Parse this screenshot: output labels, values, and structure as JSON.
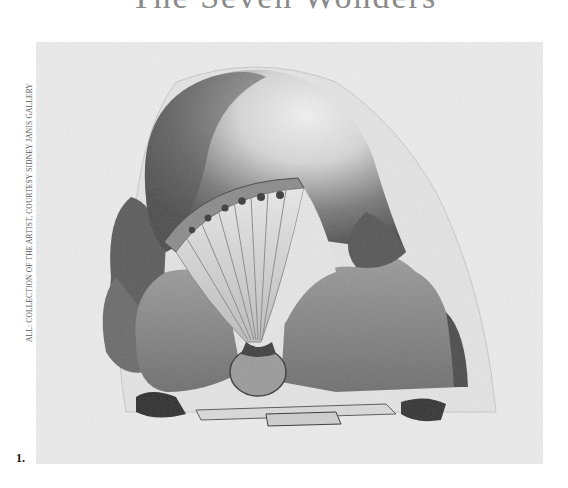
{
  "page": {
    "title": "The Seven Wonders",
    "credit_line": "ALL: COLLECTION OF THE ARTIST, COURTESY SIDNEY JANIS GALLERY",
    "figure": {
      "number": "1.",
      "description": "Pencil drawing of a large domed shell-like form with a fan of ribbed pleats, resting among rocks on a small platform"
    },
    "colors": {
      "page_background": "#ffffff",
      "paper": "#ececec",
      "graphite_dark": "#3a3a3a",
      "graphite_mid": "#7a7a7a"
    }
  }
}
